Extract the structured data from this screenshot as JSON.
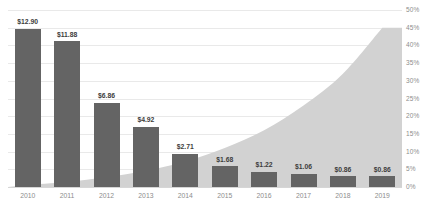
{
  "chart_data": {
    "type": "bar",
    "title": "",
    "subtitle": "",
    "xlabel": "",
    "ylabel": "",
    "grid": true,
    "legend": false,
    "categories": [
      "2010",
      "2011",
      "2012",
      "2013",
      "2014",
      "2015",
      "2016",
      "2017",
      "2018",
      "2019"
    ],
    "series": [
      {
        "name": "Bars",
        "type": "bar",
        "axis": "left",
        "values": [
          12.9,
          11.88,
          6.86,
          4.92,
          2.71,
          1.68,
          1.22,
          1.06,
          0.86,
          0.86
        ],
        "labels": [
          "$12.90",
          "$11.88",
          "$6.86",
          "$4.92",
          "$2.71",
          "$1.68",
          "$1.22",
          "$1.06",
          "$0.86",
          "$0.86"
        ],
        "color": "#646464",
        "ylim": [
          0,
          14.45
        ]
      },
      {
        "name": "Area",
        "type": "area",
        "axis": "right",
        "values": [
          0.6,
          1.4,
          2.8,
          4.6,
          7.2,
          11.0,
          16.0,
          23.0,
          32.0,
          45.0
        ],
        "color": "#d2d2d2",
        "ylim": [
          0,
          50
        ]
      }
    ],
    "right_axis": {
      "min": 0,
      "max": 50,
      "step": 5,
      "ticks": [
        "0%",
        "5%",
        "10%",
        "15%",
        "20%",
        "25%",
        "30%",
        "35%",
        "40%",
        "45%",
        "50%"
      ]
    },
    "colors": {
      "bar": "#646464",
      "area": "#d2d2d2",
      "grid": "#e9e9e9",
      "axis_text": "#8d8d8d",
      "label_text": "#3d3d3d",
      "background": "#ffffff"
    }
  }
}
